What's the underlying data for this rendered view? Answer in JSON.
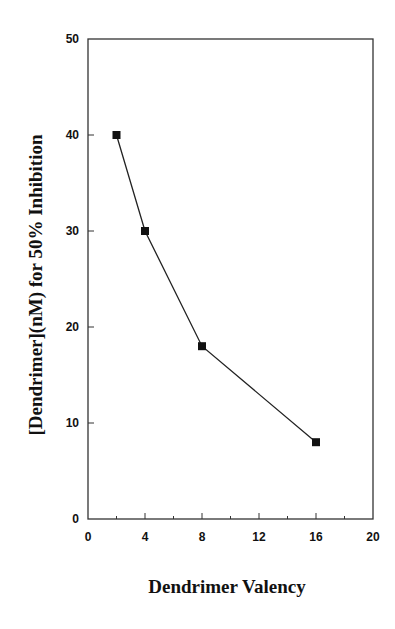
{
  "chart_data": {
    "type": "line",
    "title": "",
    "xlabel": "Dendrimer Valency",
    "ylabel": "[Dendrimer](nM) for 50% Inhibition",
    "xlim": [
      0,
      20
    ],
    "ylim": [
      0,
      50
    ],
    "x_ticks": [
      0,
      4,
      8,
      12,
      16,
      20
    ],
    "x_minor_ticks": [
      2,
      6,
      10,
      14,
      18
    ],
    "y_ticks": [
      0,
      10,
      20,
      30,
      40,
      50
    ],
    "grid": false,
    "legend": null,
    "marker": "square",
    "series": [
      {
        "name": "IC50",
        "x": [
          2,
          4,
          8,
          16
        ],
        "values": [
          40,
          30,
          18,
          8
        ]
      }
    ]
  },
  "labels": {
    "xlabel": "Dendrimer Valency",
    "ylabel": "[Dendrimer](nM) for 50% Inhibition"
  },
  "colors": {
    "axis": "#333333",
    "line": "#222222",
    "marker": "#111111"
  }
}
